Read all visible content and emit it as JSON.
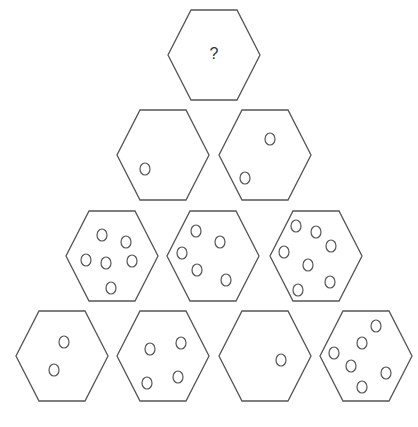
{
  "puzzle": {
    "type": "hexagon-pyramid",
    "question_label": "?",
    "colors": {
      "stroke": "#555555",
      "fill": "#ffffff",
      "text": "#333333"
    },
    "hex": {
      "rx": 46,
      "ry": 45,
      "top_half_width": 23
    },
    "dot": {
      "rx": 5,
      "ry": 6
    },
    "rows": [
      {
        "row": 1,
        "hexagons": [
          {
            "cx": 214,
            "cy": 55,
            "is_question": true,
            "dot_count": null,
            "dots": []
          }
        ]
      },
      {
        "row": 2,
        "hexagons": [
          {
            "cx": 163,
            "cy": 155,
            "dot_count": 1,
            "dots": [
              [
                145,
                169
              ]
            ]
          },
          {
            "cx": 265,
            "cy": 155,
            "dot_count": 2,
            "dots": [
              [
                270,
                139
              ],
              [
                245,
                178
              ]
            ]
          }
        ]
      },
      {
        "row": 3,
        "hexagons": [
          {
            "cx": 112,
            "cy": 256,
            "dot_count": 6,
            "dots": [
              [
                102,
                235
              ],
              [
                126,
                242
              ],
              [
                86,
                260
              ],
              [
                106,
                263
              ],
              [
                132,
                261
              ],
              [
                111,
                288
              ]
            ]
          },
          {
            "cx": 213,
            "cy": 256,
            "dot_count": 5,
            "dots": [
              [
                196,
                231
              ],
              [
                220,
                242
              ],
              [
                182,
                253
              ],
              [
                197,
                270
              ],
              [
                226,
                280
              ]
            ]
          },
          {
            "cx": 316,
            "cy": 256,
            "dot_count": 7,
            "dots": [
              [
                296,
                226
              ],
              [
                316,
                232
              ],
              [
                331,
                246
              ],
              [
                284,
                252
              ],
              [
                308,
                265
              ],
              [
                330,
                282
              ],
              [
                298,
                290
              ]
            ]
          }
        ]
      },
      {
        "row": 4,
        "hexagons": [
          {
            "cx": 62,
            "cy": 356,
            "dot_count": 2,
            "dots": [
              [
                64,
                342
              ],
              [
                54,
                370
              ]
            ]
          },
          {
            "cx": 163,
            "cy": 356,
            "dot_count": 4,
            "dots": [
              [
                150,
                349
              ],
              [
                181,
                343
              ],
              [
                147,
                383
              ],
              [
                178,
                377
              ]
            ]
          },
          {
            "cx": 265,
            "cy": 356,
            "dot_count": 1,
            "dots": [
              [
                281,
                360
              ]
            ]
          },
          {
            "cx": 366,
            "cy": 356,
            "dot_count": 6,
            "dots": [
              [
                376,
                326
              ],
              [
                362,
                343
              ],
              [
                334,
                353
              ],
              [
                351,
                366
              ],
              [
                386,
                373
              ],
              [
                362,
                387
              ]
            ]
          }
        ]
      }
    ]
  }
}
